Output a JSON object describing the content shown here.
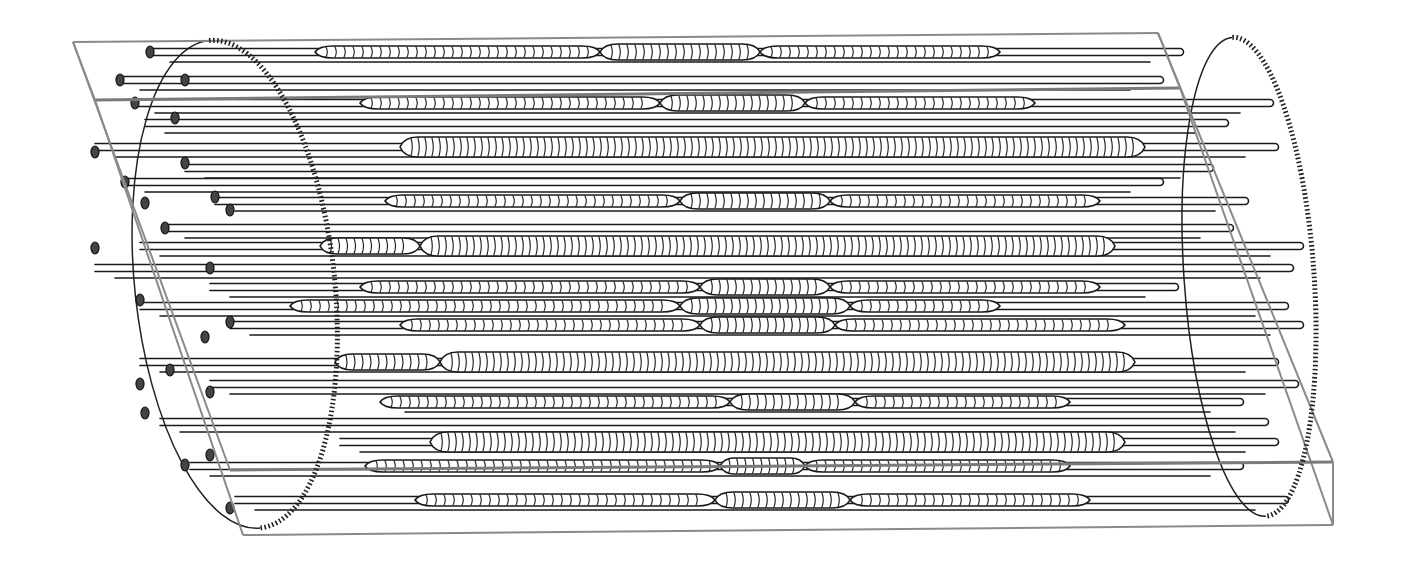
{
  "figure": {
    "description": "Line drawing of a bundle of parallel tubes inside a transparent rectangular box with elliptical end plates; middle sections of tubes show hatched coiled/ribbed segments",
    "colors": {
      "background": "#ffffff",
      "line": "#1a1a1a",
      "box": "#8a8a8a"
    },
    "box": {
      "top_left_back": [
        73,
        42
      ],
      "top_left_front": [
        95,
        100
      ],
      "top_right_back": [
        1158,
        33
      ],
      "top_right_front": [
        1180,
        88
      ],
      "bottom_left_front": [
        243,
        535
      ],
      "bottom_right_front": [
        1333,
        525
      ],
      "bottom_right_back": [
        1333,
        462
      ],
      "bottom_left_back": [
        230,
        470
      ]
    },
    "left_end_plate": {
      "cx": 180,
      "cy": 290,
      "rx": 100,
      "ry": 245
    },
    "right_end_plate": {
      "cx": 1275,
      "cy": 275,
      "rx": 65,
      "ry": 240
    },
    "rows": [
      {
        "y": 52,
        "x0": 150,
        "x1": 1180,
        "coils": [
          [
            315,
            600,
            6
          ],
          [
            600,
            760,
            8
          ],
          [
            760,
            1000,
            6
          ]
        ]
      },
      {
        "y": 80,
        "x0": 120,
        "x1": 1160,
        "coils": []
      },
      {
        "y": 103,
        "x0": 135,
        "x1": 1270,
        "coils": [
          [
            360,
            660,
            6
          ],
          [
            660,
            805,
            8
          ],
          [
            805,
            1035,
            6
          ]
        ]
      },
      {
        "y": 123,
        "x0": 145,
        "x1": 1225,
        "coils": []
      },
      {
        "y": 147,
        "x0": 95,
        "x1": 1275,
        "coils": [
          [
            400,
            1145,
            10
          ]
        ]
      },
      {
        "y": 168,
        "x0": 185,
        "x1": 1210,
        "coils": []
      },
      {
        "y": 182,
        "x0": 125,
        "x1": 1160,
        "coils": []
      },
      {
        "y": 201,
        "x0": 215,
        "x1": 1245,
        "coils": [
          [
            385,
            680,
            6
          ],
          [
            680,
            830,
            8
          ],
          [
            830,
            1100,
            6
          ]
        ]
      },
      {
        "y": 228,
        "x0": 165,
        "x1": 1230,
        "coils": []
      },
      {
        "y": 246,
        "x0": 140,
        "x1": 1300,
        "coils": [
          [
            320,
            420,
            8
          ],
          [
            420,
            1115,
            10
          ]
        ]
      },
      {
        "y": 268,
        "x0": 95,
        "x1": 1290,
        "coils": []
      },
      {
        "y": 287,
        "x0": 210,
        "x1": 1175,
        "coils": [
          [
            360,
            700,
            6
          ],
          [
            700,
            830,
            8
          ],
          [
            830,
            1100,
            6
          ]
        ]
      },
      {
        "y": 306,
        "x0": 140,
        "x1": 1285,
        "coils": [
          [
            290,
            680,
            6
          ],
          [
            680,
            850,
            8
          ],
          [
            850,
            1000,
            6
          ]
        ]
      },
      {
        "y": 325,
        "x0": 230,
        "x1": 1300,
        "coils": [
          [
            400,
            700,
            6
          ],
          [
            700,
            835,
            8
          ],
          [
            835,
            1125,
            6
          ]
        ]
      },
      {
        "y": 362,
        "x0": 140,
        "x1": 1275,
        "coils": [
          [
            335,
            440,
            8
          ],
          [
            440,
            1135,
            10
          ]
        ]
      },
      {
        "y": 384,
        "x0": 210,
        "x1": 1295,
        "coils": []
      },
      {
        "y": 402,
        "x0": 385,
        "x1": 1240,
        "coils": [
          [
            380,
            730,
            6
          ],
          [
            730,
            855,
            8
          ],
          [
            855,
            1070,
            6
          ]
        ]
      },
      {
        "y": 422,
        "x0": 160,
        "x1": 1265,
        "coils": []
      },
      {
        "y": 442,
        "x0": 340,
        "x1": 1275,
        "coils": [
          [
            430,
            1125,
            10
          ]
        ]
      },
      {
        "y": 466,
        "x0": 190,
        "x1": 1240,
        "coils": [
          [
            365,
            720,
            6
          ],
          [
            720,
            805,
            8
          ],
          [
            805,
            1070,
            6
          ]
        ]
      },
      {
        "y": 500,
        "x0": 235,
        "x1": 1285,
        "coils": [
          [
            415,
            715,
            6
          ],
          [
            715,
            850,
            8
          ],
          [
            850,
            1090,
            6
          ]
        ]
      }
    ],
    "left_caps": [
      [
        150,
        52
      ],
      [
        120,
        80
      ],
      [
        185,
        80
      ],
      [
        135,
        103
      ],
      [
        175,
        118
      ],
      [
        95,
        152
      ],
      [
        185,
        163
      ],
      [
        125,
        182
      ],
      [
        215,
        197
      ],
      [
        145,
        203
      ],
      [
        230,
        210
      ],
      [
        165,
        228
      ],
      [
        95,
        248
      ],
      [
        210,
        268
      ],
      [
        140,
        300
      ],
      [
        230,
        322
      ],
      [
        205,
        337
      ],
      [
        170,
        370
      ],
      [
        140,
        384
      ],
      [
        210,
        392
      ],
      [
        145,
        413
      ],
      [
        185,
        465
      ],
      [
        210,
        455
      ],
      [
        230,
        508
      ]
    ]
  }
}
